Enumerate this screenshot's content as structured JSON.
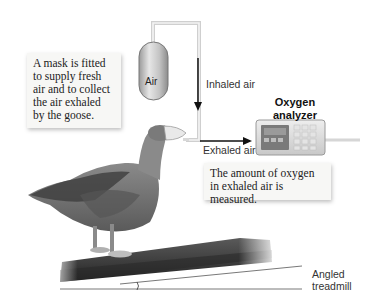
{
  "figure": {
    "callouts": {
      "mask": "A mask is fitted to supply fresh air and to collect the air exhaled by the goose.",
      "measurement": "The amount of oxygen in exhaled air is measured."
    },
    "labels": {
      "air_canister": "Air",
      "inhaled_air": "Inhaled air",
      "oxygen_analyzer_line1": "Oxygen",
      "oxygen_analyzer_line2": "analyzer",
      "exhaled_air": "Exhaled air",
      "treadmill_line1": "Angled",
      "treadmill_line2": "treadmill"
    },
    "colors": {
      "background": "#ffffff",
      "callout_bg": "#f7f7f5",
      "tube": "#d8d8d8",
      "arrow": "#111111",
      "analyzer_body": "#dcdcdc",
      "analyzer_display": "#7a7a7a",
      "treadmill": "#3a3a3a",
      "goose": "#6e6e6e"
    }
  }
}
